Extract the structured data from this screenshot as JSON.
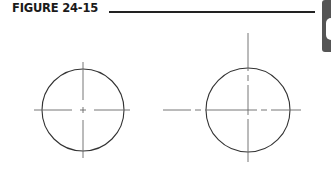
{
  "figure": {
    "label": "FIGURE 24-15"
  },
  "diagram": {
    "stroke_color": "#333333",
    "centerline_color": "#555555",
    "circles": [
      {
        "name": "left",
        "cx": 83,
        "cy": 110,
        "r": 41
      },
      {
        "name": "right",
        "cx": 248,
        "cy": 110,
        "r": 42
      }
    ]
  }
}
